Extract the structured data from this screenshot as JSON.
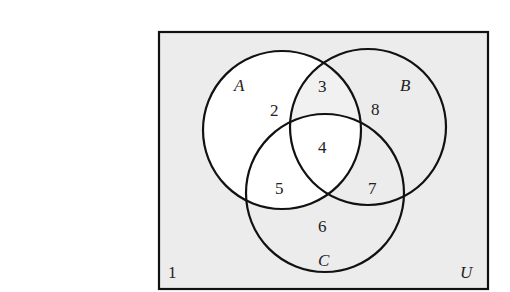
{
  "diagram": {
    "type": "venn",
    "universe_label": "U",
    "sets": [
      {
        "name": "A",
        "label": "A"
      },
      {
        "name": "B",
        "label": "B"
      },
      {
        "name": "C",
        "label": "C"
      }
    ],
    "regions": [
      {
        "id": "outside",
        "label": "1",
        "shaded": true
      },
      {
        "id": "A_only",
        "label": "2",
        "shaded": false
      },
      {
        "id": "A_and_B_only",
        "label": "3",
        "shaded": true
      },
      {
        "id": "A_and_B_and_C",
        "label": "4",
        "shaded": false
      },
      {
        "id": "A_and_C_only",
        "label": "5",
        "shaded": false
      },
      {
        "id": "C_only",
        "label": "6",
        "shaded": true
      },
      {
        "id": "B_and_C_only",
        "label": "7",
        "shaded": true
      },
      {
        "id": "B_only",
        "label": "8",
        "shaded": true
      }
    ],
    "colors": {
      "shaded": "#ececec",
      "unshaded": "#ffffff",
      "stroke": "#111111"
    }
  }
}
